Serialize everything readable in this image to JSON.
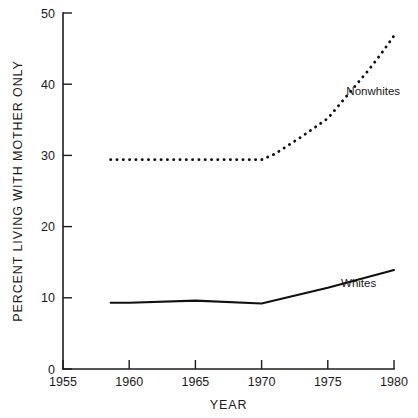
{
  "chart_data": {
    "type": "line",
    "title": "",
    "xlabel": "YEAR",
    "ylabel": "PERCENT LIVING WITH MOTHER ONLY",
    "xlim": [
      1955,
      1980
    ],
    "ylim": [
      0,
      50
    ],
    "xticks": [
      1955,
      1960,
      1965,
      1970,
      1975,
      1980
    ],
    "xtick_labels": [
      "1955",
      "1960",
      "1965",
      "1970",
      "1975",
      "1980"
    ],
    "yticks": [
      0,
      10,
      20,
      30,
      40,
      50
    ],
    "ytick_labels": [
      "0",
      "10",
      "20",
      "30",
      "40",
      "50"
    ],
    "grid": false,
    "legend_position": "inline-annotation",
    "series": [
      {
        "name": "Nonwhites",
        "style": "dotted",
        "color": "#111111",
        "label_x": 1976.4,
        "label_y": 38.5,
        "x": [
          1958.6,
          1960,
          1965,
          1970,
          1971,
          1972,
          1973,
          1974,
          1975,
          1976,
          1977,
          1978,
          1979,
          1980
        ],
        "values": [
          29.4,
          29.4,
          29.4,
          29.4,
          30.2,
          31.4,
          32.6,
          33.9,
          35.2,
          37.4,
          39.6,
          41.8,
          44.2,
          46.8
        ]
      },
      {
        "name": "Whites",
        "style": "solid",
        "color": "#111111",
        "label_x": 1976.0,
        "label_y": 11.5,
        "x": [
          1958.6,
          1960,
          1965,
          1970,
          1975,
          1980
        ],
        "values": [
          9.3,
          9.3,
          9.6,
          9.2,
          11.4,
          13.9
        ]
      }
    ],
    "annotations": [
      {
        "text": "Nonwhites",
        "x": 1976.4,
        "y": 38.5
      },
      {
        "text": "Whites",
        "x": 1976.0,
        "y": 11.5
      }
    ]
  }
}
